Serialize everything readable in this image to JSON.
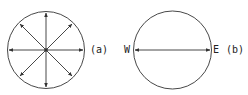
{
  "diagram": {
    "a": {
      "label": "(a)",
      "description": "circle with 8 radial arrows from center"
    },
    "b": {
      "label": "(b)",
      "west": "W",
      "east": "E",
      "description": "circle with double-headed arrow along west-east diameter"
    },
    "stroke_color": "#333333"
  }
}
